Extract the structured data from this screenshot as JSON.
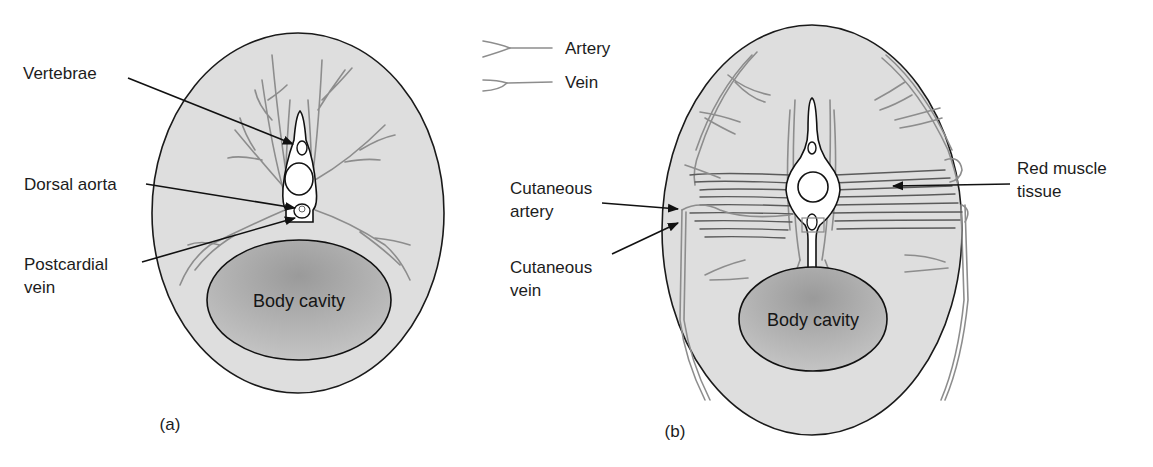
{
  "legend": {
    "items": [
      {
        "label": "Artery",
        "icon": "artery-line-icon"
      },
      {
        "label": "Vein",
        "icon": "vein-line-icon"
      }
    ]
  },
  "panel_a": {
    "caption": "(a)",
    "cavity_label": "Body cavity",
    "labels": {
      "vertebrae": "Vertebrae",
      "dorsal_aorta": "Dorsal aorta",
      "postcardial_line1": "Postcardial",
      "postcardial_line2": "vein"
    }
  },
  "panel_b": {
    "caption": "(b)",
    "cavity_label": "Body cavity",
    "labels": {
      "cut_artery_line1": "Cutaneous",
      "cut_artery_line2": "artery",
      "cut_vein_line1": "Cutaneous",
      "cut_vein_line2": "vein",
      "red_muscle_line1": "Red muscle",
      "red_muscle_line2": "tissue"
    }
  },
  "colors": {
    "body_fill": "#dcdcdc",
    "cavity_fill": "#a8a8a8",
    "vessel": "#8d8d8d",
    "outline": "#1a1a1a"
  }
}
